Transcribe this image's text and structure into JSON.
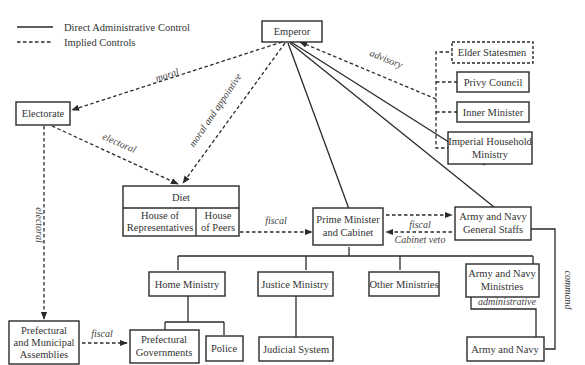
{
  "legend": {
    "solid_label": "Direct Administrative Control",
    "dashed_label": "Implied Controls"
  },
  "nodes": {
    "emperor": "Emperor",
    "elder_statesmen": "Elder Statesmen",
    "privy_council": "Privy Council",
    "inner_minister": "Inner Minister",
    "imperial_household": [
      "Imperial Household",
      "Ministry"
    ],
    "electorate": "Electorate",
    "diet": "Diet",
    "house_reps": [
      "House of",
      "Representatives"
    ],
    "house_peers": [
      "House",
      "of Peers"
    ],
    "prime_minister": [
      "Prime Minister",
      "and Cabinet"
    ],
    "general_staffs": [
      "Army and Navy",
      "General Staffs"
    ],
    "home_ministry": "Home Ministry",
    "justice_ministry": "Justice Ministry",
    "other_ministries": "Other Ministries",
    "army_navy_ministries": [
      "Army and Navy",
      "Ministries"
    ],
    "prefectural_assemblies": [
      "Prefectural",
      "and Municipal",
      "Assemblies"
    ],
    "prefectural_governments": [
      "Prefectural",
      "Governments"
    ],
    "police": "Police",
    "judicial_system": "Judicial System",
    "army_navy": "Army and Navy"
  },
  "edge_labels": {
    "moral": "moral",
    "advisory": "advisory",
    "electoral_diet": "electoral",
    "moral_appointive": "moral and appointive",
    "electoral_assemblies": "electoral",
    "fiscal_diet": "fiscal",
    "fiscal_staffs": "fiscal",
    "cabinet_veto": "Cabinet veto",
    "fiscal_assemblies": "fiscal",
    "administrative": "administrative",
    "command": "command"
  },
  "colors": {
    "line": "#2a2a2a",
    "text": "#333333",
    "background": "#ffffff"
  }
}
